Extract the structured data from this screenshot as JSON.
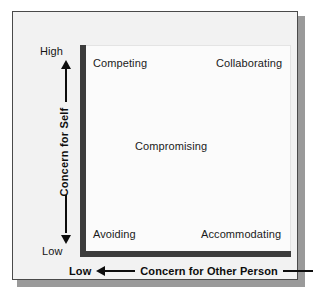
{
  "figure": {
    "background_color": "#f2f2f2",
    "plot_background_color": "#fbfbfb",
    "axis_color": "#3c3c3c",
    "border_color": "#4a4a4a",
    "shadow_color": "#9a9a9a",
    "text_color": "#1a1a1a"
  },
  "y_axis": {
    "title": "Concern for Self",
    "high_label": "High",
    "low_label": "Low",
    "up_arrow_icon": "arrow-up-icon",
    "down_arrow_icon": "arrow-down-icon"
  },
  "x_axis": {
    "title": "Concern for Other Person",
    "low_label": "Low",
    "high_label": "High",
    "left_arrow_icon": "arrow-left-icon",
    "right_arrow_icon": "arrow-right-icon"
  },
  "quadrants": [
    {
      "key": "competing",
      "label": "Competing"
    },
    {
      "key": "collaborating",
      "label": "Collaborating"
    },
    {
      "key": "compromising",
      "label": "Compromising"
    },
    {
      "key": "avoiding",
      "label": "Avoiding"
    },
    {
      "key": "accommodating",
      "label": "Accommodating"
    }
  ],
  "chart_data": {
    "type": "scatter",
    "title": "",
    "xlabel": "Concern for Other Person",
    "ylabel": "Concern for Self",
    "xlim": [
      0,
      100
    ],
    "ylim": [
      0,
      100
    ],
    "xtick_labels": [
      "Low",
      "High"
    ],
    "ytick_labels": [
      "Low",
      "High"
    ],
    "grid": false,
    "legend": "none",
    "points": [
      {
        "label": "Competing",
        "x": 8,
        "y": 94
      },
      {
        "label": "Collaborating",
        "x": 68,
        "y": 94
      },
      {
        "label": "Compromising",
        "x": 30,
        "y": 52
      },
      {
        "label": "Avoiding",
        "x": 8,
        "y": 12
      },
      {
        "label": "Accommodating",
        "x": 60,
        "y": 12
      }
    ],
    "annotations": [
      "Competing",
      "Collaborating",
      "Compromising",
      "Avoiding",
      "Accommodating"
    ]
  }
}
